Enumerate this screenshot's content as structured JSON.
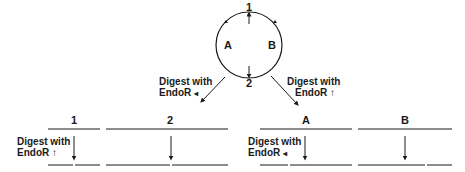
{
  "plasmid": {
    "site_top": "1",
    "site_bottom": "2",
    "region_left": "A",
    "region_right": "B"
  },
  "digests": {
    "left": {
      "line1": "Digest with",
      "line2": "EndoR",
      "marker": "◂"
    },
    "right": {
      "line1": "Digest with",
      "line2": "EndoR",
      "marker": "↑"
    }
  },
  "fragments": [
    {
      "label": "1",
      "digest_line1": "Digest with",
      "digest_line2": "EndoR",
      "marker": "↑"
    },
    {
      "label": "2"
    },
    {
      "label": "A",
      "digest_line1": "Digest with",
      "digest_line2": "EndoR",
      "marker": "◂"
    },
    {
      "label": "B"
    }
  ]
}
